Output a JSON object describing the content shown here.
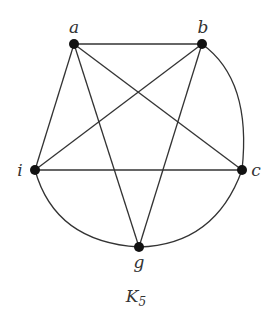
{
  "diagram": {
    "title": "K",
    "title_subscript": "5",
    "nodes": [
      {
        "id": "a",
        "label": "a"
      },
      {
        "id": "b",
        "label": "b"
      },
      {
        "id": "c",
        "label": "c"
      },
      {
        "id": "g",
        "label": "g"
      },
      {
        "id": "i",
        "label": "i"
      }
    ],
    "edges": [
      [
        "a",
        "b"
      ],
      [
        "a",
        "c"
      ],
      [
        "a",
        "g"
      ],
      [
        "a",
        "i"
      ],
      [
        "b",
        "c"
      ],
      [
        "b",
        "g"
      ],
      [
        "b",
        "i"
      ],
      [
        "c",
        "g"
      ],
      [
        "c",
        "i"
      ],
      [
        "g",
        "i"
      ]
    ]
  }
}
